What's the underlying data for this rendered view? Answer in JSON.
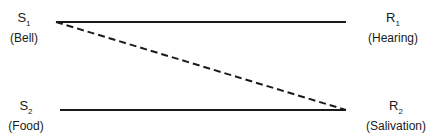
{
  "diagram": {
    "type": "classical-conditioning",
    "nodes": {
      "s1": {
        "symbol": "S",
        "sub": "1",
        "label": "(Bell)"
      },
      "s2": {
        "symbol": "S",
        "sub": "2",
        "label": "(Food)"
      },
      "r1": {
        "symbol": "R",
        "sub": "1",
        "label": "(Hearing)"
      },
      "r2": {
        "symbol": "R",
        "sub": "2",
        "label": "(Salivation)"
      }
    },
    "edges": [
      {
        "from": "s1",
        "to": "r1",
        "style": "solid"
      },
      {
        "from": "s2",
        "to": "r2",
        "style": "solid"
      },
      {
        "from": "s1",
        "to": "r2",
        "style": "dashed"
      }
    ],
    "line_color": "#1a1a1a"
  }
}
